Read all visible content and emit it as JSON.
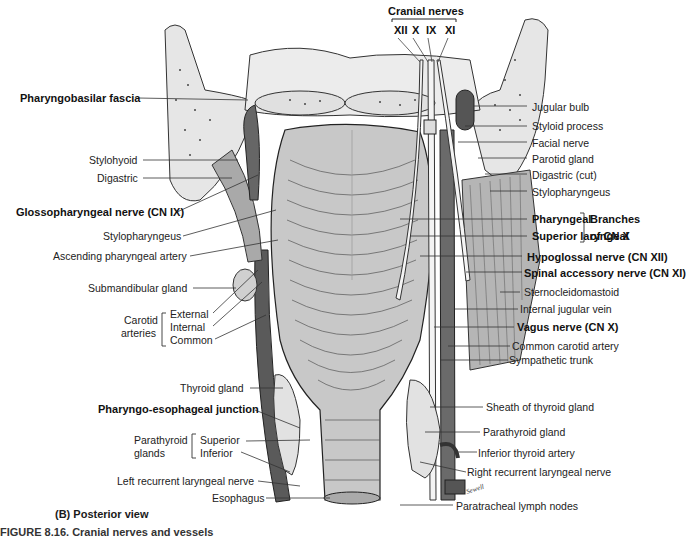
{
  "figure": {
    "view_label": "(B) Posterior view",
    "caption_partial": "FIGURE 8.16. Cranial nerves and vessels",
    "signature": "Sewell"
  },
  "cranial_nerves": {
    "title": "Cranial nerves",
    "numerals": [
      "XII",
      "X",
      "IX",
      "XI"
    ]
  },
  "left_labels": {
    "pharyngobasilar_fascia": "Pharyngobasilar fascia",
    "stylohyoid": "Stylohyoid",
    "digastric": "Digastric",
    "glossopharyngeal": "Glossopharyngeal nerve (CN IX)",
    "stylopharyngeus": "Stylopharyngeus",
    "ascending_pharyngeal_artery": "Ascending pharyngeal artery",
    "submandibular_gland": "Submandibular gland",
    "carotid_group": "Carotid arteries",
    "carotid_group_line1": "Carotid",
    "carotid_group_line2": "arteries",
    "carotid_external": "External",
    "carotid_internal": "Internal",
    "carotid_common": "Common",
    "thyroid_gland": "Thyroid gland",
    "pharyngo_esophageal_junction": "Pharyngo-esophageal junction",
    "parathyroid_group_line1": "Parathyroid",
    "parathyroid_group_line2": "glands",
    "parathyroid_superior": "Superior",
    "parathyroid_inferior": "Inferior",
    "left_recurrent_laryngeal_nerve": "Left recurrent laryngeal nerve",
    "esophagus": "Esophagus"
  },
  "right_labels": {
    "jugular_bulb": "Jugular bulb",
    "styloid_process": "Styloid process",
    "facial_nerve": "Facial nerve",
    "parotid_gland": "Parotid gland",
    "digastric_cut": "Digastric (cut)",
    "stylopharyngeus": "Stylopharyngeus",
    "pharyngeal": "Pharyngeal",
    "superior_laryngeal": "Superior laryngeal",
    "branches_line1": "Branches",
    "branches_line2": "of CN X",
    "hypoglossal": "Hypoglossal nerve (CN XII)",
    "spinal_accessory": "Spinal accessory nerve (CN XI)",
    "sternocleidomastoid": "Sternocleidomastoid",
    "internal_jugular_vein": "Internal jugular vein",
    "vagus": "Vagus nerve (CN X)",
    "common_carotid_artery": "Common carotid artery",
    "sympathetic_trunk": "Sympathetic trunk",
    "sheath_of_thyroid_gland": "Sheath of thyroid gland",
    "parathyroid_gland": "Parathyroid gland",
    "inferior_thyroid_artery": "Inferior thyroid artery",
    "right_recurrent_laryngeal_nerve": "Right recurrent laryngeal nerve",
    "paratracheal_lymph_nodes": "Paratracheal lymph nodes"
  },
  "colors": {
    "bone": "#e4e4e4",
    "muscle": "#b8b8b8",
    "dark_vessel": "#555555",
    "nerve": "#f4f4f4",
    "line": "#333333"
  }
}
